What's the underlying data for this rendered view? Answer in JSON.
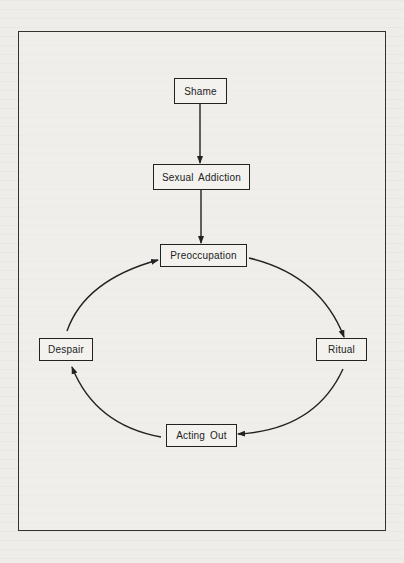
{
  "diagram": {
    "type": "flowchart-cycle",
    "nodes": [
      {
        "id": "shame",
        "label": "Shame"
      },
      {
        "id": "sexual_addiction",
        "label": "Sexual Addiction"
      },
      {
        "id": "preoccupation",
        "label": "Preoccupation"
      },
      {
        "id": "ritual",
        "label": "Ritual"
      },
      {
        "id": "acting_out",
        "label": "Acting Out"
      },
      {
        "id": "despair",
        "label": "Despair"
      }
    ],
    "edges": [
      {
        "from": "shame",
        "to": "sexual_addiction"
      },
      {
        "from": "sexual_addiction",
        "to": "preoccupation"
      },
      {
        "from": "preoccupation",
        "to": "ritual"
      },
      {
        "from": "ritual",
        "to": "acting_out"
      },
      {
        "from": "acting_out",
        "to": "despair"
      },
      {
        "from": "despair",
        "to": "preoccupation"
      }
    ],
    "colors": {
      "line": "#222222",
      "background": "#eeede9"
    }
  }
}
